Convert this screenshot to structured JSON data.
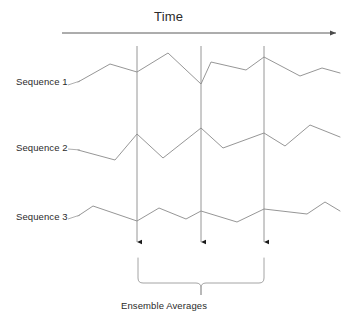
{
  "diagram": {
    "time_axis": {
      "label": "Time",
      "arrow_name": "time-arrow",
      "x_start": 62,
      "x_end": 340,
      "y": 33
    },
    "sequences": [
      {
        "label": "Sequence 1",
        "name": "sequence-1",
        "points": "78,82 110,64 137,72 168,53 201,84 211,62 246,70 264,57 300,76 322,68 340,73"
      },
      {
        "label": "Sequence 2",
        "name": "sequence-2",
        "points": "78,150 115,160 137,134 163,158 201,128 223,148 264,133 285,146 310,125 340,137"
      },
      {
        "label": "Sequence 3",
        "name": "sequence-3",
        "points": "78,216 93,206 137,221 159,208 186,219 201,211 237,222 264,209 307,214 325,202 340,211"
      }
    ],
    "sampling_lines": [
      {
        "name": "sampling-line-1",
        "x": 137,
        "y_top": 46,
        "y_bottom": 247
      },
      {
        "name": "sampling-line-2",
        "x": 201,
        "y_top": 46,
        "y_bottom": 247
      },
      {
        "name": "sampling-line-3",
        "x": 264,
        "y_top": 46,
        "y_bottom": 247
      }
    ],
    "brace": {
      "caption": "Ensemble Averages",
      "name": "ensemble-brace",
      "x_left": 138,
      "x_right": 264,
      "x_center": 201,
      "y_top": 258,
      "y_bar": 283,
      "y_point": 295
    },
    "colors": {
      "line": "#7a7a7a",
      "text": "#2b2b2b",
      "axis": "#5a5a5a",
      "background": "#ffffff"
    }
  }
}
